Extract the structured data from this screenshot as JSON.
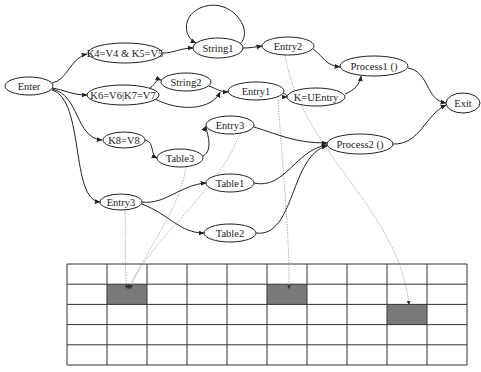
{
  "diagram": {
    "nodes": [
      {
        "id": "enter",
        "label": "Enter",
        "cx": 29,
        "cy": 86,
        "rx": 24,
        "ry": 9
      },
      {
        "id": "k4k5",
        "label": "K4=V4 & K5=V5",
        "cx": 125,
        "cy": 53,
        "rx": 37,
        "ry": 10
      },
      {
        "id": "k6k7",
        "label": "K6=V6|K7=V7",
        "cx": 123,
        "cy": 95,
        "rx": 36,
        "ry": 10
      },
      {
        "id": "string1",
        "label": "String1",
        "cx": 218,
        "cy": 48,
        "rx": 25,
        "ry": 10
      },
      {
        "id": "string2",
        "label": "String2",
        "cx": 186,
        "cy": 82,
        "rx": 25,
        "ry": 9
      },
      {
        "id": "entry2",
        "label": "Entry2",
        "cx": 288,
        "cy": 46,
        "rx": 26,
        "ry": 9
      },
      {
        "id": "entry1",
        "label": "Entry1",
        "cx": 256,
        "cy": 91,
        "rx": 28,
        "ry": 9
      },
      {
        "id": "kuentry",
        "label": "K=UEntry",
        "cx": 316,
        "cy": 97,
        "rx": 29,
        "ry": 9
      },
      {
        "id": "process1",
        "label": "Process1 ()",
        "cx": 374,
        "cy": 66,
        "rx": 34,
        "ry": 10
      },
      {
        "id": "exit",
        "label": "Exit",
        "cx": 463,
        "cy": 103,
        "rx": 17,
        "ry": 10
      },
      {
        "id": "k8",
        "label": "K8=V8",
        "cx": 124,
        "cy": 140,
        "rx": 21,
        "ry": 8
      },
      {
        "id": "table3",
        "label": "Table3",
        "cx": 180,
        "cy": 158,
        "rx": 23,
        "ry": 9
      },
      {
        "id": "entry3a",
        "label": "Entry3",
        "cx": 230,
        "cy": 125,
        "rx": 24,
        "ry": 9
      },
      {
        "id": "process2",
        "label": "Process2 ()",
        "cx": 360,
        "cy": 144,
        "rx": 33,
        "ry": 10
      },
      {
        "id": "table1",
        "label": "Table1",
        "cx": 230,
        "cy": 183,
        "rx": 24,
        "ry": 9
      },
      {
        "id": "entry3b",
        "label": "Entry3",
        "cx": 121,
        "cy": 202,
        "rx": 21,
        "ry": 8
      },
      {
        "id": "table2",
        "label": "Table2",
        "cx": 230,
        "cy": 233,
        "rx": 26,
        "ry": 9
      }
    ],
    "edges": [
      {
        "from": "enter",
        "to": "k4k5",
        "d": "M52,83 C68,80 70,58 87,54"
      },
      {
        "from": "enter",
        "to": "k6k7",
        "d": "M52,88 C65,90 72,95 87,95"
      },
      {
        "from": "enter",
        "to": "k8",
        "d": "M52,89 C80,95 75,138 102,140"
      },
      {
        "from": "enter",
        "to": "entry3b",
        "d": "M52,90 C85,100 70,200 100,202"
      },
      {
        "from": "k4k5",
        "to": "string1",
        "d": "M162,53 C175,53 180,48 193,48"
      },
      {
        "from": "string1",
        "to": "string1",
        "d": "M240,44 C255,30 230,-5 200,8 C180,18 185,38 196,43"
      },
      {
        "from": "string1",
        "to": "entry2",
        "d": "M243,48 C250,48 255,47 262,46"
      },
      {
        "from": "k6k7",
        "to": "string2",
        "d": "M150,88 C156,84 156,78 161,80"
      },
      {
        "from": "k6k7",
        "to": "entry1",
        "d": "M155,99 C180,112 212,110 220,92"
      },
      {
        "from": "string2",
        "to": "entry1",
        "d": "M209,86 C215,88 220,92 228,92"
      },
      {
        "from": "entry1",
        "to": "kuentry",
        "d": "M283,93 C290,96 285,97 287,97"
      },
      {
        "from": "entry2",
        "to": "process1",
        "d": "M313,49 C325,58 325,65 340,67"
      },
      {
        "from": "kuentry",
        "to": "process1",
        "d": "M345,94 C355,90 360,84 361,76"
      },
      {
        "from": "process1",
        "to": "exit",
        "d": "M408,68 C430,72 425,100 446,103"
      },
      {
        "from": "process2",
        "to": "exit",
        "d": "M393,144 C420,145 425,115 446,105"
      },
      {
        "from": "k8",
        "to": "table3",
        "d": "M145,140 C155,142 150,155 157,158"
      },
      {
        "from": "table3",
        "to": "entry3a",
        "d": "M203,156 C215,150 205,128 206,126"
      },
      {
        "from": "entry3a",
        "to": "process2",
        "d": "M254,127 C280,135 295,143 327,143"
      },
      {
        "from": "table1",
        "to": "process2",
        "d": "M254,183 C285,190 295,150 327,145"
      },
      {
        "from": "table2",
        "to": "process2",
        "d": "M256,233 C295,238 290,155 327,146"
      },
      {
        "from": "entry3b",
        "to": "table1",
        "d": "M142,202 C165,205 180,185 206,183"
      },
      {
        "from": "entry3b",
        "to": "table2",
        "d": "M142,204 C170,215 180,233 204,233"
      }
    ],
    "dotted_edges": [
      {
        "from": "entry3b",
        "to": "cell-r1c1",
        "d": "M125,210 C126,240 124,260 127,289"
      },
      {
        "from": "table3",
        "to": "cell-r1c1",
        "d": "M186,167 C180,210 145,250 130,289"
      },
      {
        "from": "entry3a",
        "to": "cell-r1c1",
        "d": "M240,133 C220,190 150,240 128,289"
      },
      {
        "from": "entry1",
        "to": "cell-r1c5",
        "d": "M278,100 C282,160 290,240 289,289"
      },
      {
        "from": "entry2",
        "to": "cell-r2c8",
        "d": "M285,55 C300,150 400,210 409,305"
      }
    ]
  },
  "grid": {
    "x": 67,
    "y": 264,
    "width": 400,
    "height": 101,
    "rows": 5,
    "cols": 10,
    "shaded_cells": [
      {
        "row": 1,
        "col": 1,
        "color": "#7a7a7a"
      },
      {
        "row": 1,
        "col": 5,
        "color": "#7a7a7a"
      },
      {
        "row": 2,
        "col": 8,
        "color": "#7a7a7a"
      }
    ]
  },
  "colors": {
    "line": "#222222",
    "dotted_line": "#9a9a9a",
    "shaded_cell": "#7a7a7a",
    "background": "#ffffff"
  }
}
